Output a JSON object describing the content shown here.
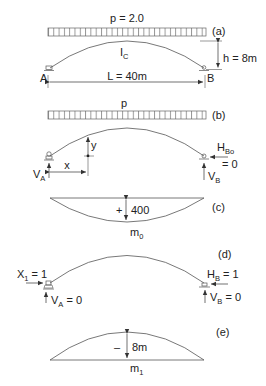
{
  "panels": {
    "a": {
      "tag": "(a)",
      "load_label": "p = 2.0",
      "inertia_main": "I",
      "inertia_sub": "C",
      "height_label": "h = 8m",
      "span_label": "L = 40m",
      "support_a": "A",
      "support_b": "B"
    },
    "b": {
      "tag": "(b)",
      "load_label": "p",
      "y_label": "y",
      "x_label": "x",
      "va_main": "V",
      "va_sub": "A",
      "hbo_main": "H",
      "hbo_sub": "Bo",
      "hbo_value": "= 0",
      "vb_main": "V",
      "vb_sub": "B"
    },
    "c": {
      "tag": "(c)",
      "sign": "+",
      "value": "400",
      "name_main": "m",
      "name_sub": "0"
    },
    "d": {
      "tag": "(d)",
      "x1_main": "X",
      "x1_sub": "1",
      "x1_value": " = 1",
      "hb_main": "H",
      "hb_sub": "B",
      "hb_value": " = 1",
      "va_main": "V",
      "va_sub": "A",
      "va_value": " = 0",
      "vb_main": "V",
      "vb_sub": "B",
      "vb_value": " = 0"
    },
    "e": {
      "tag": "(e)",
      "sign": "–",
      "value": "8m",
      "name_main": "m",
      "name_sub": "1"
    }
  },
  "colors": {
    "line": "#555555",
    "text": "#222222"
  }
}
